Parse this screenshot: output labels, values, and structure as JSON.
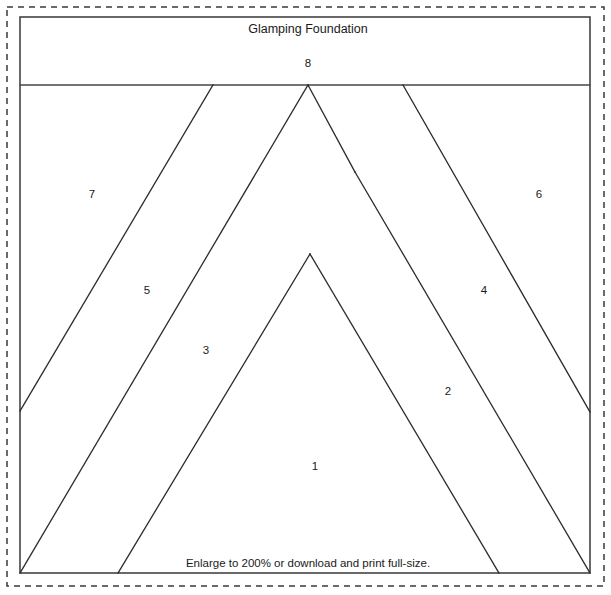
{
  "document": {
    "title": "Glamping Foundation",
    "footer_note": "Enlarge to 200% or download and print full-size.",
    "type": "foundation-paper-piecing-pattern"
  },
  "colors": {
    "line": "#2b2b2b",
    "frame": "#444444",
    "dashed_frame": "#3a3a3a",
    "background": "#ffffff",
    "text": "#1a1a1a"
  },
  "pieces": [
    {
      "number": "1",
      "label_x": 315,
      "label_y": 467
    },
    {
      "number": "2",
      "label_x": 448,
      "label_y": 392
    },
    {
      "number": "3",
      "label_x": 206,
      "label_y": 351
    },
    {
      "number": "4",
      "label_x": 484,
      "label_y": 291
    },
    {
      "number": "5",
      "label_x": 147,
      "label_y": 291
    },
    {
      "number": "6",
      "label_x": 539,
      "label_y": 195
    },
    {
      "number": "7",
      "label_x": 92,
      "label_y": 195
    },
    {
      "number": "8",
      "label_x": 308,
      "label_y": 64
    }
  ],
  "geometry": {
    "dashed_border": {
      "x": 7,
      "y": 7,
      "width": 597,
      "height": 579
    },
    "solid_border": {
      "x": 20,
      "y": 17,
      "width": 570,
      "height": 556
    },
    "header_divider_y": 85,
    "apex": {
      "x": 308,
      "y": 85
    },
    "junction_right": {
      "x": 355,
      "y": 172
    },
    "junction_left": {
      "x": 310,
      "y": 254
    },
    "seams": [
      {
        "name": "seam-7-5",
        "points": "213,85 20,411"
      },
      {
        "name": "seam-5-3",
        "points": "308,85 20,573"
      },
      {
        "name": "seam-3-1",
        "points": "310,254 118,573"
      },
      {
        "name": "seam-6-4",
        "points": "403,85 590,412"
      },
      {
        "name": "seam-4-2",
        "points": "355,172 590,573"
      },
      {
        "name": "seam-2-1",
        "points": "310,254 499,573"
      },
      {
        "name": "seam-apex-right",
        "points": "308,85 355,172"
      }
    ]
  },
  "title_position": {
    "x": 308,
    "y": 30
  },
  "footer_position": {
    "x": 308,
    "y": 564
  }
}
